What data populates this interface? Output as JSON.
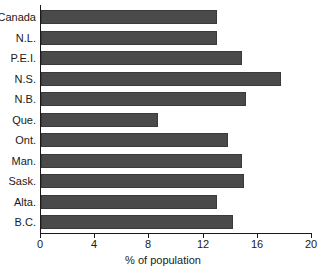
{
  "chart_data": {
    "type": "bar",
    "orientation": "horizontal",
    "title": "",
    "subtitle": "",
    "xlabel": "% of population",
    "ylabel": "",
    "xlim": [
      0,
      20
    ],
    "xticks": [
      0,
      4,
      8,
      12,
      16,
      20
    ],
    "xtick_labels": [
      "0",
      "4",
      "8",
      "12",
      "16",
      "20"
    ],
    "grid": false,
    "legend": null,
    "bar_color": "#4a4a4a",
    "background_color": "#ffffff",
    "axis_color": "#1a1a1a",
    "categories": [
      "Canada",
      "N.L.",
      "P.E.I.",
      "N.S.",
      "N.B.",
      "Que.",
      "Ont.",
      "Man.",
      "Sask.",
      "Alta.",
      "B.C."
    ],
    "values": [
      13.0,
      13.0,
      14.8,
      17.7,
      15.1,
      8.6,
      13.8,
      14.8,
      15.0,
      13.0,
      14.2
    ],
    "series": [
      {
        "name": "% of population",
        "values": [
          13.0,
          13.0,
          14.8,
          17.7,
          15.1,
          8.6,
          13.8,
          14.8,
          15.0,
          13.0,
          14.2
        ]
      }
    ]
  }
}
